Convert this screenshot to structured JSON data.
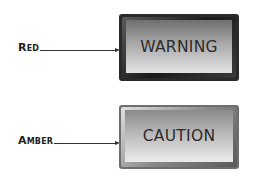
{
  "indicators": [
    {
      "callout": "Red",
      "label": "WARNING",
      "face_gradient": [
        "#7a7a7a",
        "#d8d8d8"
      ],
      "frame_color": "#2a2a2a"
    },
    {
      "callout": "Amber",
      "label": "CAUTION",
      "face_gradient": [
        "#8e8e8e",
        "#e2e2e2"
      ],
      "frame_color": "#6e6e6e"
    }
  ]
}
